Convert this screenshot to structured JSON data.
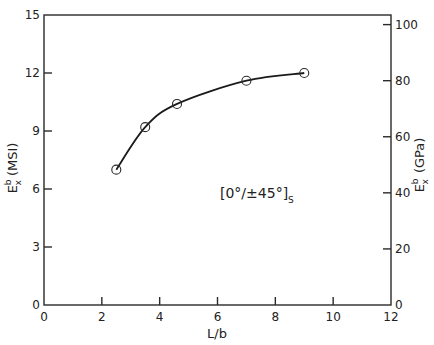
{
  "chart_data": {
    "type": "line",
    "title": "",
    "xlabel": "L/b",
    "ylabel": "E_x^b (MSI)",
    "ylabel_right": "E_x^b (GPa)",
    "xlim": [
      0,
      12
    ],
    "ylim": [
      0,
      15
    ],
    "ylim_right": [
      0,
      103.4
    ],
    "x_ticks": [
      0,
      2,
      4,
      6,
      8,
      10,
      12
    ],
    "y_ticks": [
      0,
      3,
      6,
      9,
      12,
      15
    ],
    "y_ticks_right": [
      0,
      20,
      40,
      60,
      80,
      100
    ],
    "grid": false,
    "legend": null,
    "annotation": "[0°/±45°]s",
    "series": [
      {
        "name": "[0°/±45°]s",
        "marker": "open-circle",
        "line": "smooth",
        "x": [
          2.5,
          3.5,
          4.6,
          7.0,
          9.0
        ],
        "y": [
          7.0,
          9.2,
          10.4,
          11.6,
          12.0
        ]
      }
    ]
  },
  "labels": {
    "xlabel": "L/b",
    "ylabel_left_main": "E",
    "ylabel_left_sup": "b",
    "ylabel_left_sub": "x",
    "ylabel_left_unit": "(MSI)",
    "ylabel_right_main": "E",
    "ylabel_right_sup": "b",
    "ylabel_right_sub": "x",
    "ylabel_right_unit": "(GPa)",
    "annotation_main": "[0°/±45°]",
    "annotation_sub": "S"
  }
}
